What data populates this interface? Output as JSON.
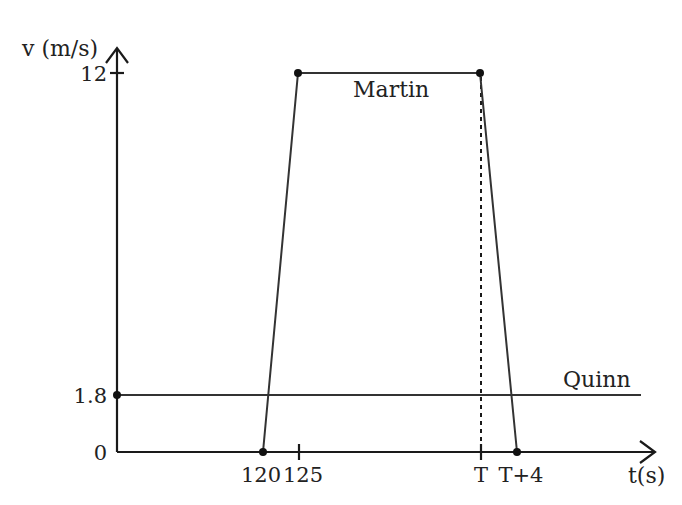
{
  "figure": {
    "y_axis_label": "v (m/s)",
    "x_axis_label": "t(s)",
    "y_ticks": [
      {
        "value": 12,
        "label": "12"
      },
      {
        "value": 1.8,
        "label": "1.8"
      },
      {
        "value": 0,
        "label": "0"
      }
    ],
    "x_ticks": [
      {
        "key": "t120",
        "label": "120"
      },
      {
        "key": "t125",
        "label": "125"
      },
      {
        "key": "T",
        "label": "T"
      },
      {
        "key": "T4",
        "label": "T+4"
      }
    ],
    "series": [
      {
        "name": "Martin",
        "label": "Martin",
        "points": [
          {
            "t": "120",
            "v": 0
          },
          {
            "t": "125",
            "v": 12
          },
          {
            "t": "T",
            "v": 12
          },
          {
            "t": "T+4",
            "v": 0
          }
        ]
      },
      {
        "name": "Quinn",
        "label": "Quinn",
        "constant_v": 1.8
      }
    ],
    "dashed_marker": {
      "t": "T",
      "from_v": 12,
      "to_v": 0
    }
  }
}
